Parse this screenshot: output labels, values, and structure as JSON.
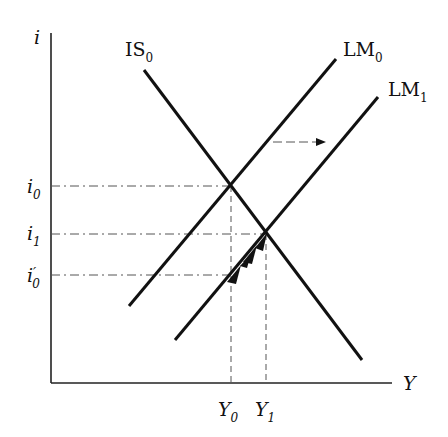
{
  "diagram": {
    "type": "IS-LM",
    "axes": {
      "y_label": "i",
      "x_label": "Y"
    },
    "curves": [
      {
        "name": "IS",
        "sub": "0"
      },
      {
        "name": "LM",
        "sub": "0"
      },
      {
        "name": "LM",
        "sub": "1"
      }
    ],
    "y_ticks": [
      {
        "base": "i",
        "sub": "0",
        "prime": ""
      },
      {
        "base": "i",
        "sub": "1",
        "prime": ""
      },
      {
        "base": "i",
        "sub": "0",
        "prime": "′"
      }
    ],
    "x_ticks": [
      {
        "base": "Y",
        "sub": "0"
      },
      {
        "base": "Y",
        "sub": "1"
      }
    ],
    "annotations": [
      "shift arrow LM0 to LM1",
      "adjustment arrows along LM1 from i0' to i1"
    ],
    "colors": {
      "line": "#111111",
      "guide": "#555555"
    }
  }
}
